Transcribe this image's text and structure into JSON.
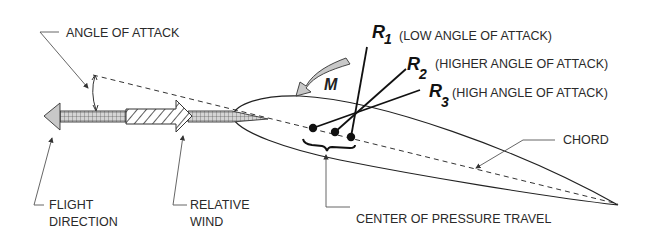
{
  "diagram": {
    "labels": {
      "angle_of_attack": "ANGLE OF ATTACK",
      "flight_direction_line1": "FLIGHT",
      "flight_direction_line2": "DIRECTION",
      "relative_wind_line1": "RELATIVE",
      "relative_wind_line2": "WIND",
      "chord": "CHORD",
      "center_of_pressure_travel": "CENTER OF PRESSURE TRAVEL",
      "moment": "M"
    },
    "resultants": [
      {
        "symbol": "R",
        "subscript": "1",
        "description": "(LOW ANGLE OF ATTACK)"
      },
      {
        "symbol": "R",
        "subscript": "2",
        "description": "(HIGHER ANGLE OF ATTACK)"
      },
      {
        "symbol": "R",
        "subscript": "3",
        "description": "(HIGH ANGLE OF ATTACK)"
      }
    ],
    "colors": {
      "line": "#222222",
      "leader": "#555555",
      "arrow_fill": "#c8c8c8",
      "background": "#ffffff"
    }
  }
}
